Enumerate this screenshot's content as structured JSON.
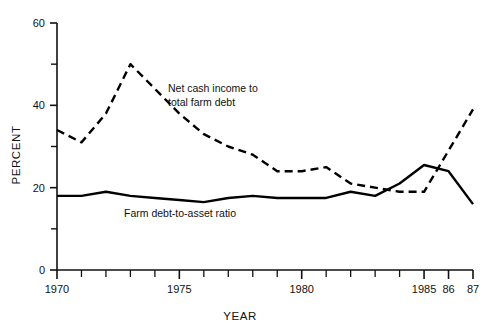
{
  "chart_data": {
    "type": "line",
    "title": "",
    "xlabel": "YEAR",
    "ylabel": "PERCENT",
    "xlim": [
      1970,
      1987
    ],
    "ylim": [
      0,
      60
    ],
    "grid": false,
    "legend_position": "inline-annotations",
    "x": [
      1970,
      1971,
      1972,
      1973,
      1974,
      1975,
      1976,
      1977,
      1978,
      1979,
      1980,
      1981,
      1982,
      1983,
      1984,
      1985,
      1986,
      1987
    ],
    "x_major_ticks": [
      1970,
      1975,
      1980,
      1985,
      1986,
      1987
    ],
    "x_major_tick_labels": [
      "1970",
      "1975",
      "1980",
      "1985",
      "86",
      "87"
    ],
    "y_major_ticks": [
      0,
      20,
      40,
      60
    ],
    "y_major_tick_labels": [
      "0",
      "20",
      "40",
      "60"
    ],
    "y_minor_ticks": [
      10,
      30,
      50
    ],
    "series": [
      {
        "name": "Net cash income to total farm debt",
        "style": "dashed",
        "color": "#000000",
        "label_line1": "Net cash income to",
        "label_line2": "total farm debt",
        "values": [
          34,
          31,
          38,
          50,
          44,
          38,
          33,
          30,
          28,
          24,
          24,
          25,
          21,
          20,
          19,
          19,
          29,
          39
        ]
      },
      {
        "name": "Farm debt-to-asset ratio",
        "style": "solid",
        "color": "#000000",
        "label_line1": "Farm debt-to-asset ratio",
        "label_line2": "",
        "values": [
          18,
          18,
          19,
          18,
          17.5,
          17,
          16.5,
          17.5,
          18,
          17.5,
          17.5,
          17.5,
          19,
          18,
          21,
          25.5,
          24,
          16
        ]
      }
    ]
  },
  "axis": {
    "y_title": "PERCENT",
    "x_title": "YEAR"
  }
}
